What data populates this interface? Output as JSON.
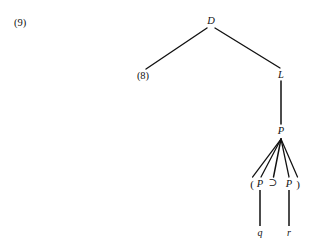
{
  "figure": {
    "example_number": "(9)",
    "background_color": "#ffffff",
    "ink_color": "#111111",
    "width": 323,
    "height": 250
  },
  "tree": {
    "root": {
      "label": "D",
      "x": 211,
      "y": 21
    },
    "left_child": {
      "label": "(8)",
      "x": 143,
      "y": 76,
      "is_subtree_reference": true
    },
    "right_child": {
      "label": "L",
      "x": 281,
      "y": 75
    },
    "right_grandchild": {
      "label": "P",
      "x": 281,
      "y": 131
    },
    "leaf_row": [
      {
        "label": "(",
        "x": 252,
        "y": 184,
        "kind": "paren"
      },
      {
        "label": "P",
        "x": 260,
        "y": 184,
        "kind": "category"
      },
      {
        "label": "⊃",
        "x": 273,
        "y": 183,
        "kind": "operator"
      },
      {
        "label": "P",
        "x": 289,
        "y": 184,
        "kind": "category"
      },
      {
        "label": ")",
        "x": 298,
        "y": 184,
        "kind": "paren"
      }
    ],
    "terminals": [
      {
        "label": "q",
        "x": 260,
        "y": 233,
        "parent_x": 260
      },
      {
        "label": "r",
        "x": 289,
        "y": 233,
        "parent_x": 289
      }
    ]
  },
  "edges": {
    "root_to_left": {
      "x1": 207,
      "y1": 28,
      "x2": 146,
      "y2": 69
    },
    "root_to_right": {
      "x1": 215,
      "y1": 28,
      "x2": 280,
      "y2": 68
    },
    "right_to_grandchild": {
      "x1": 281,
      "y1": 81,
      "x2": 281,
      "y2": 124
    },
    "fan_apex": {
      "x": 281,
      "y": 139
    },
    "fan_targets": [
      252,
      261,
      273,
      289,
      298
    ],
    "fan_bottom_y": 177,
    "terminal_line_top_y": 190,
    "terminal_line_bottom_y": 226
  },
  "stroke": {
    "branch_width": 1.3,
    "fan_width": 1.25,
    "stem_width": 1.5
  }
}
